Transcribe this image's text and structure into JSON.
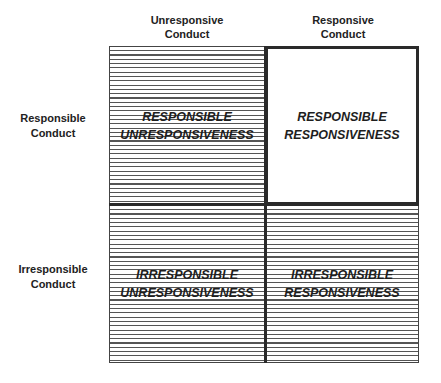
{
  "columns": [
    {
      "label_line1": "Unresponsive",
      "label_line2": "Conduct"
    },
    {
      "label_line1": "Responsive",
      "label_line2": "Conduct"
    }
  ],
  "rows": [
    {
      "label_line1": "Responsible",
      "label_line2": "Conduct"
    },
    {
      "label_line1": "Irresponsible",
      "label_line2": "Conduct"
    }
  ],
  "cells": {
    "top_left": {
      "line1": "RESPONSIBLE",
      "line2": "UNRESPONSIVENESS",
      "pattern": "hatched"
    },
    "top_right": {
      "line1": "RESPONSIBLE",
      "line2": "RESPONSIVENESS",
      "pattern": "plain"
    },
    "bottom_left": {
      "line1": "IRRESPONSIBLE",
      "line2": "UNRESPONSIVENESS",
      "pattern": "hatched"
    },
    "bottom_right": {
      "line1": "IRRESPONSIBLE",
      "line2": "RESPONSIVENESS",
      "pattern": "hatched"
    }
  },
  "colors": {
    "line": "#2a2a2a",
    "hatch": "#555555",
    "background": "#ffffff"
  }
}
